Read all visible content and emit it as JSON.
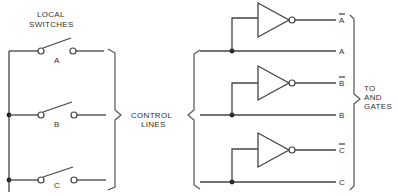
{
  "labels": {
    "local_switches_line1": "LOCAL",
    "local_switches_line2": "SWITCHES",
    "control_lines_line1": "CONTROL",
    "control_lines_line2": "LINES",
    "to_and_gates_line1": "TO",
    "to_and_gates_line2": "AND",
    "to_and_gates_line3": "GATES"
  },
  "switches": [
    {
      "name": "A",
      "label": "A"
    },
    {
      "name": "B",
      "label": "B"
    },
    {
      "name": "C",
      "label": "C"
    }
  ],
  "outputs": [
    {
      "signal": "A",
      "inverted": true,
      "label": "A"
    },
    {
      "signal": "A",
      "inverted": false,
      "label": "A"
    },
    {
      "signal": "B",
      "inverted": true,
      "label": "B"
    },
    {
      "signal": "B",
      "inverted": false,
      "label": "B"
    },
    {
      "signal": "C",
      "inverted": true,
      "label": "C"
    },
    {
      "signal": "C",
      "inverted": false,
      "label": "C"
    }
  ],
  "colors": {
    "line": "#444444",
    "text": "#333333",
    "background": "#ffffff"
  }
}
